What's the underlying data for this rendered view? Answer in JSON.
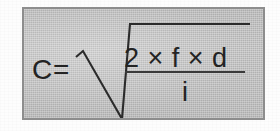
{
  "figure": {
    "kind": "scanned-equation-box",
    "background_color": "#fdfdfd",
    "panel_color": "#c3c3c3",
    "border_color": "#8d8d8d",
    "ink_color": "#232323"
  },
  "equation": {
    "full_text": "C = √(2 × f × d / i)",
    "left_variable": "C",
    "equals_sign": "=",
    "radical_symbol": "√",
    "numerator": "2 × f × d",
    "denominator": "i",
    "fraction_bar": "",
    "terms": {
      "constant": "2",
      "factor_1": "f",
      "factor_2": "d",
      "divisor": "i",
      "multiplication_sign": "×"
    }
  }
}
